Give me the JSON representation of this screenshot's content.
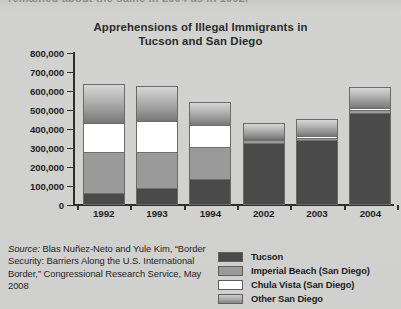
{
  "page": {
    "cut_off_body_text": "remained about the same in 2004 as in 1992.",
    "background_color": "#d0d0ce"
  },
  "source_note": {
    "label": "Source:",
    "text": " Blas Nuñez-Neto and Yule Kim, “Border Security: Barriers Along the U.S. International Border,” Congressional Research Service, May 2008"
  },
  "legend": {
    "position": "bottom-right",
    "items": [
      {
        "label": "Tucson",
        "color": "#4a4a4a",
        "swatch": "solid-dark-gray"
      },
      {
        "label": "Imperial Beach (San Diego)",
        "color": "#9a9a9a",
        "swatch": "solid-medium-gray"
      },
      {
        "label": "Chula Vista (San Diego)",
        "color": "#ffffff",
        "swatch": "solid-white"
      },
      {
        "label": "Other San Diego",
        "color": "#a8a8a8",
        "swatch": "gradient-gray"
      }
    ]
  },
  "chart_data": {
    "type": "bar",
    "subtype": "stacked-vertical",
    "title": "Apprehensions of Illegal Immigrants in Tucson and San Diego",
    "title_line1": "Apprehensions of Illegal Immigrants in",
    "title_line2": "Tucson and San Diego",
    "xlabel": "",
    "ylabel": "",
    "categories": [
      "1992",
      "1993",
      "1994",
      "2002",
      "2003",
      "2004"
    ],
    "ylim": [
      0,
      800000
    ],
    "yticks": [
      0,
      100000,
      200000,
      300000,
      400000,
      500000,
      600000,
      700000,
      800000
    ],
    "ytick_labels": [
      "0",
      "100,000",
      "200,000",
      "300,000",
      "400,000",
      "500,000",
      "600,000",
      "700,000",
      "800,000"
    ],
    "grid": false,
    "series": [
      {
        "name": "Tucson",
        "color": "#4a4a4a",
        "values": [
          70000,
          95000,
          140000,
          330000,
          345000,
          490000
        ]
      },
      {
        "name": "Imperial Beach (San Diego)",
        "color": "#9a9a9a",
        "values": [
          215000,
          190000,
          170000,
          15000,
          15000,
          15000
        ]
      },
      {
        "name": "Chula Vista (San Diego)",
        "color": "#ffffff",
        "values": [
          150000,
          160000,
          115000,
          10000,
          10000,
          10000
        ]
      },
      {
        "name": "Other San Diego",
        "color": "#a8a8a8",
        "values": [
          200000,
          180000,
          115000,
          75000,
          85000,
          105000
        ]
      }
    ],
    "totals": [
      635000,
      625000,
      540000,
      430000,
      455000,
      620000
    ]
  }
}
